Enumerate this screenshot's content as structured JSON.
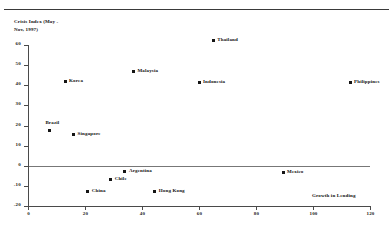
{
  "figure": {
    "top_stub": "",
    "ylabel_line1": "Crisis Index (May -",
    "ylabel_line2": "Nov, 1997)",
    "xlabel": "Growth in Lending"
  },
  "chart_data": {
    "type": "scatter",
    "title": "",
    "xlabel": "Growth in Lending",
    "ylabel": "Crisis Index (May - Nov, 1997)",
    "xlim": [
      0,
      120
    ],
    "ylim": [
      -20,
      60
    ],
    "xticks": [
      0,
      20,
      40,
      60,
      80,
      100,
      120
    ],
    "yticks": [
      -20,
      -10,
      0,
      10,
      20,
      30,
      40,
      50,
      60
    ],
    "xtick_labels": [
      "0",
      "20",
      "40",
      "60",
      "80",
      "100",
      "120"
    ],
    "ytick_labels": [
      "-20",
      "-10",
      "0",
      "10",
      "20",
      "30",
      "40",
      "50",
      "60"
    ],
    "grid": false,
    "legend": false,
    "zero_line": true,
    "points": [
      {
        "label": "Thailand",
        "x": 65.0,
        "y": 62.0,
        "label_pos": "right"
      },
      {
        "label": "Malaysia",
        "x": 37.0,
        "y": 47.0,
        "label_pos": "right"
      },
      {
        "label": "Korea",
        "x": 13.0,
        "y": 42.0,
        "label_pos": "right"
      },
      {
        "label": "Indonesia",
        "x": 60.0,
        "y": 41.5,
        "label_pos": "right"
      },
      {
        "label": "Philippines",
        "x": 113.0,
        "y": 41.5,
        "label_pos": "right"
      },
      {
        "label": "Brazil",
        "x": 7.5,
        "y": 17.5,
        "label_pos": "top"
      },
      {
        "label": "Singapore",
        "x": 16.0,
        "y": 15.5,
        "label_pos": "right"
      },
      {
        "label": "Argentina",
        "x": 34.0,
        "y": -3.0,
        "label_pos": "right"
      },
      {
        "label": "Mexico",
        "x": 89.5,
        "y": -3.5,
        "label_pos": "right"
      },
      {
        "label": "Chile",
        "x": 29.0,
        "y": -7.0,
        "label_pos": "right"
      },
      {
        "label": "China",
        "x": 21.0,
        "y": -13.0,
        "label_pos": "right"
      },
      {
        "label": "Hong Kong",
        "x": 44.5,
        "y": -13.0,
        "label_pos": "right"
      }
    ]
  }
}
